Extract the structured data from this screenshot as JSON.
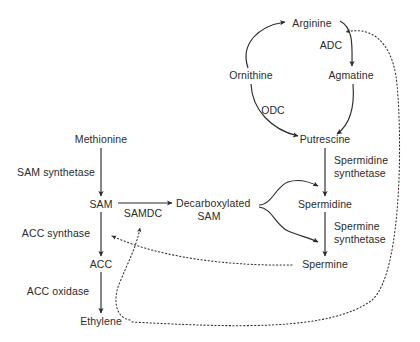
{
  "diagram": {
    "background_color": "#ffffff",
    "stroke_color": "#2b2b2b",
    "text_color": "#2b2b2b",
    "metabolites": [
      {
        "id": "methionine",
        "label": "Methionine",
        "x": 101,
        "y": 140
      },
      {
        "id": "sam",
        "label": "SAM",
        "x": 101,
        "y": 205
      },
      {
        "id": "dcsam",
        "label": "Decarboxylated SAM",
        "x": 208,
        "y": 205
      },
      {
        "id": "acc",
        "label": "ACC",
        "x": 101,
        "y": 265
      },
      {
        "id": "ethylene",
        "label": "Ethylene",
        "x": 101,
        "y": 322
      },
      {
        "id": "arginine",
        "label": "Arginine",
        "x": 312,
        "y": 24
      },
      {
        "id": "ornithine",
        "label": "Ornithine",
        "x": 251,
        "y": 76
      },
      {
        "id": "agmatine",
        "label": "Agmatine",
        "x": 351,
        "y": 76
      },
      {
        "id": "putrescine",
        "label": "Putrescine",
        "x": 325,
        "y": 140
      },
      {
        "id": "spermidine",
        "label": "Spermidine",
        "x": 325,
        "y": 205
      },
      {
        "id": "spermine",
        "label": "Spermine",
        "x": 325,
        "y": 265
      }
    ],
    "enzymes": [
      {
        "id": "sam-synthetase",
        "label": "SAM synthetase",
        "x": 55,
        "y": 172
      },
      {
        "id": "samdc",
        "label": "SAMDC",
        "x": 143,
        "y": 213
      },
      {
        "id": "acc-synthase",
        "label": "ACC synthase",
        "x": 55,
        "y": 233
      },
      {
        "id": "acc-oxidase",
        "label": "ACC oxidase",
        "x": 57,
        "y": 291
      },
      {
        "id": "adc",
        "label": "ADC",
        "x": 331,
        "y": 45
      },
      {
        "id": "odc",
        "label": "ODC",
        "x": 272,
        "y": 110
      },
      {
        "id": "spermidine-synthetase",
        "label": "Spermidine synthetase",
        "x": 355,
        "y": 166
      },
      {
        "id": "spermine-synthetase",
        "label": "Spermine synthetase",
        "x": 355,
        "y": 232
      }
    ],
    "reactions": [
      {
        "from": "methionine",
        "to": "sam",
        "enzyme": "SAM synthetase",
        "style": "solid"
      },
      {
        "from": "sam",
        "to": "dcsam",
        "enzyme": "SAMDC",
        "style": "solid"
      },
      {
        "from": "sam",
        "to": "acc",
        "enzyme": "ACC synthase",
        "style": "solid"
      },
      {
        "from": "acc",
        "to": "ethylene",
        "enzyme": "ACC oxidase",
        "style": "solid"
      },
      {
        "from": "ornithine",
        "to": "arginine",
        "enzyme": "",
        "style": "solid"
      },
      {
        "from": "arginine",
        "to": "agmatine",
        "enzyme": "ADC",
        "style": "solid"
      },
      {
        "from": "ornithine",
        "to": "putrescine",
        "enzyme": "ODC",
        "style": "solid"
      },
      {
        "from": "agmatine",
        "to": "putrescine",
        "enzyme": "",
        "style": "solid"
      },
      {
        "from": "putrescine",
        "to": "spermidine",
        "enzyme": "Spermidine synthetase",
        "style": "solid"
      },
      {
        "from": "spermidine",
        "to": "spermine",
        "enzyme": "Spermine synthetase",
        "style": "solid"
      },
      {
        "from": "dcsam",
        "to": "spermidine",
        "enzyme": "",
        "style": "solid"
      },
      {
        "from": "dcsam",
        "to": "spermine",
        "enzyme": "",
        "style": "solid"
      },
      {
        "from": "spermine",
        "to": "acc-synthase-step",
        "enzyme": "",
        "style": "dotted"
      },
      {
        "from": "ethylene",
        "to": "samdc",
        "enzyme": "",
        "style": "dotted"
      },
      {
        "from": "ethylene",
        "to": "adc",
        "enzyme": "",
        "style": "dotted"
      }
    ]
  }
}
